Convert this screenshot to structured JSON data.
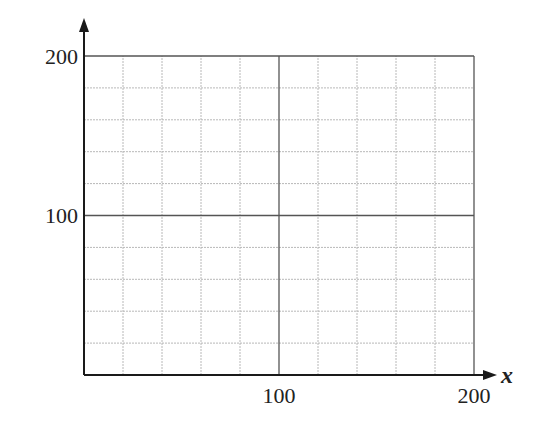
{
  "chart_data": {
    "type": "line",
    "title": "",
    "xlabel": "x",
    "ylabel": "",
    "xlim": [
      0,
      200
    ],
    "ylim": [
      0,
      200
    ],
    "x_ticks": [
      100,
      200
    ],
    "y_ticks": [
      100,
      200
    ],
    "x_tick_labels": [
      "100",
      "200"
    ],
    "y_tick_labels": [
      "100",
      "200"
    ],
    "grid": true,
    "grid_step": 20,
    "major_lines": [
      100
    ],
    "series": []
  },
  "colors": {
    "axis": "#1a1a1a",
    "grid_minor": "#b8b8b8",
    "grid_major": "#555555",
    "text": "#222222"
  }
}
